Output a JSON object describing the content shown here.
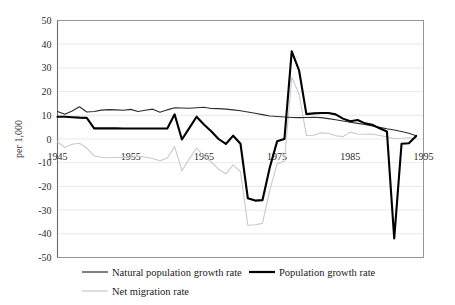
{
  "chart_data": {
    "type": "line",
    "title": "",
    "subtitle": "",
    "xlabel": "",
    "ylabel": "per 1,000",
    "xlim": [
      1945,
      1995
    ],
    "ylim": [
      -50,
      50
    ],
    "grid": true,
    "grid_axis": "y",
    "legend_position": "bottom",
    "x_tick_labels": [
      "1945",
      "1955",
      "1965",
      "1975",
      "1985",
      "1995"
    ],
    "x_ticks": [
      1945,
      1955,
      1965,
      1975,
      1985,
      1995
    ],
    "y_tick_labels": [
      "50",
      "40",
      "30",
      "20",
      "10",
      "0",
      "-10",
      "-20",
      "-30",
      "-40",
      "-50"
    ],
    "y_ticks": [
      50,
      40,
      30,
      20,
      10,
      0,
      -10,
      -20,
      -30,
      -40,
      -50
    ],
    "x": [
      1945,
      1946,
      1947,
      1948,
      1949,
      1950,
      1951,
      1952,
      1953,
      1954,
      1955,
      1956,
      1957,
      1958,
      1959,
      1960,
      1961,
      1962,
      1963,
      1964,
      1965,
      1966,
      1967,
      1968,
      1969,
      1970,
      1971,
      1972,
      1973,
      1974,
      1975,
      1976,
      1977,
      1978,
      1979,
      1980,
      1981,
      1982,
      1983,
      1984,
      1985,
      1986,
      1987,
      1988,
      1989,
      1990,
      1991,
      1992,
      1993,
      1994
    ],
    "series": [
      {
        "name": "Natural population growth rate",
        "color": "#2c2c2c",
        "line_width": 1.1,
        "values": [
          11.6,
          10.4,
          11.8,
          13.6,
          11.4,
          11.6,
          12.2,
          12.4,
          12.3,
          12.1,
          12.5,
          11.6,
          12.1,
          12.6,
          11.3,
          12.3,
          13.2,
          13.1,
          13.0,
          13.2,
          13.4,
          12.9,
          12.8,
          12.6,
          12.3,
          11.9,
          11.4,
          10.9,
          10.3,
          9.7,
          9.5,
          9.3,
          9.1,
          9.0,
          9.1,
          9.2,
          9.0,
          8.6,
          8.1,
          7.6,
          7.1,
          6.6,
          6.1,
          5.5,
          4.9,
          4.3,
          3.8,
          3.2,
          2.4,
          1.4
        ]
      },
      {
        "name": "Population growth rate",
        "color": "#000000",
        "line_width": 2.1,
        "values": [
          9.4,
          9.4,
          9.2,
          9.0,
          8.9,
          4.5,
          4.5,
          4.5,
          4.5,
          4.4,
          4.4,
          4.4,
          4.4,
          4.4,
          4.4,
          4.4,
          10.4,
          -0.2,
          4.6,
          9.4,
          6.1,
          3.3,
          0.0,
          -2.1,
          1.4,
          -2.0,
          -25.0,
          -26.0,
          -25.8,
          -12.0,
          -1.0,
          0.0,
          37.0,
          29.0,
          10.5,
          10.8,
          11.0,
          11.0,
          10.4,
          8.6,
          7.5,
          8.0,
          6.6,
          6.0,
          4.5,
          3.2,
          -42.0,
          -2.0,
          -1.8,
          1.3
        ]
      },
      {
        "name": "Net migration rate",
        "color": "#c9c9cf",
        "line_width": 1.1,
        "values": [
          -1.2,
          -3.6,
          -2.2,
          -1.8,
          -3.8,
          -7.1,
          -7.7,
          -7.9,
          -7.8,
          -7.7,
          -7.8,
          -7.2,
          -7.7,
          -8.2,
          -9.2,
          -8.0,
          -3.2,
          -13.4,
          -8.4,
          -3.8,
          -7.3,
          -9.6,
          -12.8,
          -14.7,
          -10.9,
          -13.9,
          -36.4,
          -36.2,
          -35.6,
          -21.7,
          -10.5,
          -9.3,
          26.0,
          19.0,
          1.5,
          1.6,
          2.6,
          2.4,
          1.4,
          1.0,
          2.9,
          2.1,
          2.0,
          2.1,
          1.5,
          0.9,
          0.2,
          0.3,
          0.5,
          0.2
        ]
      }
    ]
  },
  "axis": {
    "y_title": "per 1,000"
  },
  "legend": {
    "items": [
      {
        "label": "Natural population growth rate",
        "swatch": "thin-dark-line"
      },
      {
        "label": "Population growth rate",
        "swatch": "thick-black-line"
      },
      {
        "label": "Net migration rate",
        "swatch": "thin-light-line"
      }
    ]
  }
}
